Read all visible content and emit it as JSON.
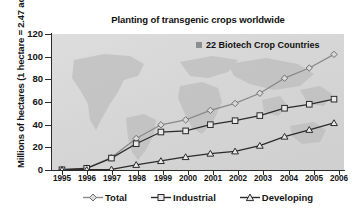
{
  "chart_data": {
    "type": "line",
    "title": "Planting of transgenic crops worldwide",
    "xlabel": "",
    "ylabel": "Millions of hectares (1 hectare = 2.47 acres)",
    "annotation": "22 Biotech Crop Countries",
    "categories": [
      "1995",
      "1996",
      "1997",
      "1998",
      "1999",
      "2000",
      "2001",
      "2002",
      "2003",
      "2004",
      "2005",
      "2006"
    ],
    "ylim": [
      0,
      120
    ],
    "yticks": [
      0,
      20,
      40,
      60,
      80,
      100,
      120
    ],
    "grid": false,
    "legend_position": "bottom",
    "series": [
      {
        "name": "Total",
        "marker": "diamond",
        "color": "#8a8a8a",
        "values": [
          0.2,
          1.7,
          11.0,
          27.8,
          39.9,
          44.2,
          52.6,
          58.7,
          67.7,
          81.0,
          90.0,
          102.0
        ]
      },
      {
        "name": "Industrial",
        "marker": "square",
        "color": "#2b2b2b",
        "values": [
          0.2,
          1.5,
          10.5,
          23.2,
          33.5,
          34.5,
          40.0,
          43.5,
          48.0,
          54.5,
          58.0,
          62.5
        ]
      },
      {
        "name": "Developing",
        "marker": "triangle",
        "color": "#2b2b2b",
        "values": [
          0.0,
          0.2,
          0.6,
          4.6,
          8.0,
          11.5,
          14.5,
          16.5,
          21.5,
          29.5,
          35.5,
          41.5
        ]
      }
    ]
  },
  "axis": {
    "y_tick_labels": [
      "0",
      "20",
      "40",
      "60",
      "80",
      "100",
      "120"
    ],
    "x_tick_labels": [
      "1995",
      "1996",
      "1997",
      "1998",
      "1999",
      "2000",
      "2001",
      "2002",
      "2003",
      "2004",
      "2005",
      "2006"
    ]
  },
  "legend": {
    "items": [
      {
        "label": "Total",
        "marker": "diamond-marker-icon"
      },
      {
        "label": "Industrial",
        "marker": "square-marker-icon"
      },
      {
        "label": "Developing",
        "marker": "triangle-marker-icon"
      }
    ]
  },
  "colors": {
    "plot_background": "#d8d8d8",
    "map_silhouette": "#b9b9b9",
    "total_series": "#8a8a8a",
    "industrial_series": "#2b2b2b",
    "developing_series": "#2b2b2b"
  }
}
